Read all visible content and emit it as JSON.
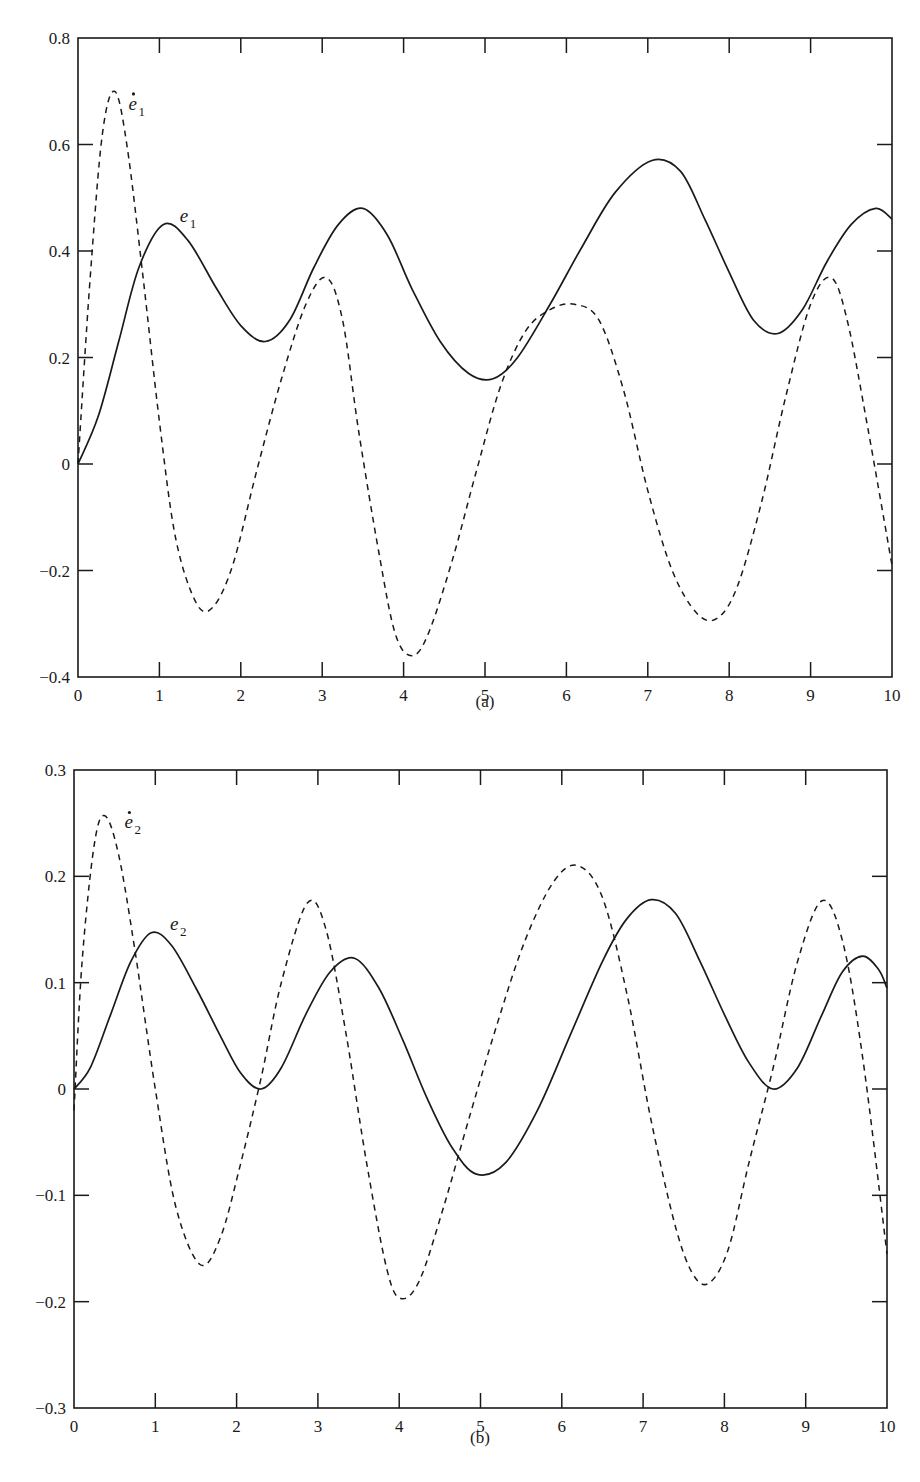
{
  "chart_data": [
    {
      "type": "line",
      "caption": "(a)",
      "title": "",
      "xlabel": "",
      "ylabel": "",
      "xlim": [
        0,
        10
      ],
      "ylim": [
        -0.4,
        0.8
      ],
      "xticks": [
        0,
        1,
        2,
        3,
        4,
        5,
        6,
        7,
        8,
        9,
        10
      ],
      "xtick_labels": [
        "0",
        "1",
        "2",
        "3",
        "4",
        "5",
        "6",
        "7",
        "8",
        "9",
        "10"
      ],
      "yticks": [
        -0.4,
        -0.2,
        0,
        0.2,
        0.4,
        0.6,
        0.8
      ],
      "ytick_labels": [
        "-0.4",
        "-0.2",
        "0",
        "0.2",
        "0.4",
        "0.6",
        "0.8"
      ],
      "grid": false,
      "legend": "inline curve labels",
      "series": [
        {
          "name": "e1",
          "label_text": "e",
          "label_sub": "1",
          "label_dot": false,
          "style": "solid",
          "label_pos": [
            1.25,
            0.455
          ],
          "x": [
            0,
            0.25,
            0.5,
            0.75,
            1.05,
            1.35,
            1.7,
            2.0,
            2.3,
            2.6,
            2.9,
            3.2,
            3.5,
            3.8,
            4.1,
            4.45,
            4.8,
            5.1,
            5.4,
            5.8,
            6.2,
            6.6,
            7.05,
            7.4,
            7.7,
            8.0,
            8.3,
            8.6,
            8.9,
            9.2,
            9.5,
            9.8,
            10.0
          ],
          "y": [
            0.0,
            0.09,
            0.23,
            0.37,
            0.45,
            0.42,
            0.33,
            0.26,
            0.23,
            0.27,
            0.37,
            0.45,
            0.48,
            0.43,
            0.33,
            0.23,
            0.17,
            0.16,
            0.2,
            0.3,
            0.41,
            0.51,
            0.57,
            0.55,
            0.46,
            0.36,
            0.27,
            0.245,
            0.29,
            0.38,
            0.45,
            0.48,
            0.46
          ]
        },
        {
          "name": "e1_dot",
          "label_text": "e",
          "label_sub": "1",
          "label_dot": true,
          "style": "dashed",
          "label_pos": [
            0.62,
            0.665
          ],
          "x": [
            0,
            0.15,
            0.3,
            0.45,
            0.6,
            0.8,
            1.0,
            1.2,
            1.45,
            1.65,
            1.9,
            2.2,
            2.5,
            2.8,
            3.05,
            3.25,
            3.45,
            3.7,
            3.9,
            4.1,
            4.3,
            4.6,
            4.9,
            5.2,
            5.5,
            5.8,
            6.1,
            6.4,
            6.7,
            7.0,
            7.3,
            7.6,
            7.85,
            8.1,
            8.4,
            8.7,
            9.0,
            9.25,
            9.45,
            9.7,
            10.0
          ],
          "y": [
            0.0,
            0.35,
            0.62,
            0.7,
            0.6,
            0.35,
            0.08,
            -0.14,
            -0.26,
            -0.27,
            -0.19,
            -0.01,
            0.16,
            0.3,
            0.35,
            0.27,
            0.06,
            -0.17,
            -0.32,
            -0.36,
            -0.32,
            -0.18,
            -0.01,
            0.15,
            0.25,
            0.29,
            0.3,
            0.27,
            0.14,
            -0.05,
            -0.2,
            -0.28,
            -0.29,
            -0.23,
            -0.07,
            0.13,
            0.3,
            0.35,
            0.27,
            0.07,
            -0.19
          ]
        }
      ]
    },
    {
      "type": "line",
      "caption": "(b)",
      "title": "",
      "xlabel": "",
      "ylabel": "",
      "xlim": [
        0,
        10
      ],
      "ylim": [
        -0.3,
        0.3
      ],
      "xticks": [
        0,
        1,
        2,
        3,
        4,
        5,
        6,
        7,
        8,
        9,
        10
      ],
      "xtick_labels": [
        "0",
        "1",
        "2",
        "3",
        "4",
        "5",
        "6",
        "7",
        "8",
        "9",
        "10"
      ],
      "yticks": [
        -0.3,
        -0.2,
        -0.1,
        0,
        0.1,
        0.2,
        0.3
      ],
      "ytick_labels": [
        "-0.3",
        "-0.2",
        "-0.1",
        "0",
        "0.1",
        "0.2",
        "0.3"
      ],
      "grid": false,
      "legend": "inline curve labels",
      "series": [
        {
          "name": "e2",
          "label_text": "e",
          "label_sub": "2",
          "label_dot": false,
          "style": "solid",
          "label_pos": [
            1.18,
            0.15
          ],
          "x": [
            0,
            0.2,
            0.45,
            0.7,
            0.95,
            1.2,
            1.5,
            1.8,
            2.05,
            2.3,
            2.55,
            2.85,
            3.15,
            3.45,
            3.75,
            4.05,
            4.35,
            4.65,
            4.95,
            5.3,
            5.7,
            6.1,
            6.5,
            6.8,
            7.1,
            7.4,
            7.7,
            8.0,
            8.3,
            8.6,
            8.9,
            9.2,
            9.45,
            9.7,
            9.9,
            10.0
          ],
          "y": [
            0.0,
            0.02,
            0.07,
            0.12,
            0.147,
            0.135,
            0.095,
            0.05,
            0.015,
            0.0,
            0.02,
            0.07,
            0.11,
            0.123,
            0.095,
            0.045,
            -0.01,
            -0.055,
            -0.08,
            -0.07,
            -0.02,
            0.05,
            0.12,
            0.16,
            0.178,
            0.165,
            0.12,
            0.07,
            0.025,
            0.0,
            0.02,
            0.07,
            0.11,
            0.125,
            0.112,
            0.095
          ]
        },
        {
          "name": "e2_dot",
          "label_text": "e",
          "label_sub": "2",
          "label_dot": true,
          "style": "dashed",
          "label_pos": [
            0.62,
            0.245
          ],
          "x": [
            0,
            0.1,
            0.25,
            0.38,
            0.55,
            0.75,
            1.0,
            1.25,
            1.55,
            1.8,
            2.05,
            2.3,
            2.55,
            2.87,
            3.1,
            3.35,
            3.6,
            3.85,
            4.02,
            4.25,
            4.55,
            4.85,
            5.2,
            5.55,
            5.9,
            6.2,
            6.5,
            6.8,
            7.1,
            7.4,
            7.62,
            7.82,
            8.05,
            8.3,
            8.6,
            8.9,
            9.2,
            9.45,
            9.7,
            10.0
          ],
          "y": [
            -0.02,
            0.12,
            0.23,
            0.257,
            0.22,
            0.13,
            0.0,
            -0.11,
            -0.165,
            -0.14,
            -0.07,
            0.01,
            0.1,
            0.175,
            0.15,
            0.05,
            -0.07,
            -0.17,
            -0.197,
            -0.18,
            -0.11,
            -0.03,
            0.06,
            0.14,
            0.195,
            0.21,
            0.18,
            0.09,
            -0.03,
            -0.13,
            -0.175,
            -0.182,
            -0.15,
            -0.07,
            0.02,
            0.12,
            0.177,
            0.14,
            0.03,
            -0.155
          ]
        }
      ]
    }
  ]
}
